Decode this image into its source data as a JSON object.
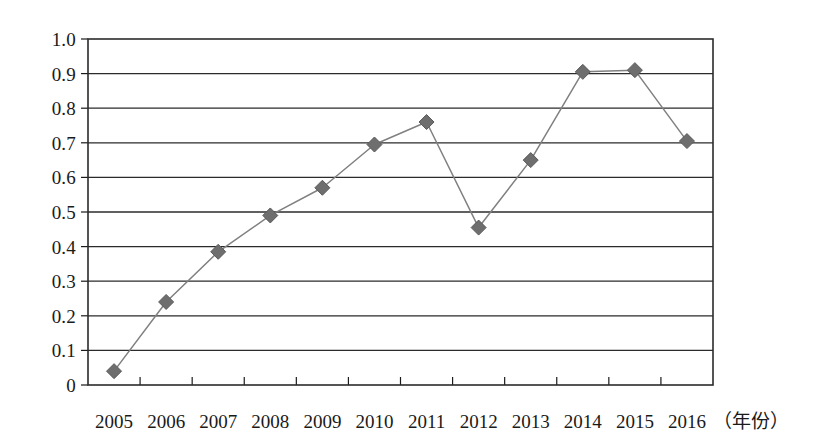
{
  "chart_data": {
    "type": "line",
    "title": "",
    "xlabel": "（年份）",
    "ylabel": "",
    "categories": [
      "2005",
      "2006",
      "2007",
      "2008",
      "2009",
      "2010",
      "2011",
      "2012",
      "2013",
      "2014",
      "2015",
      "2016"
    ],
    "values": [
      0.04,
      0.24,
      0.385,
      0.49,
      0.57,
      0.695,
      0.76,
      0.455,
      0.65,
      0.905,
      0.91,
      0.705
    ],
    "series": [
      {
        "name": "",
        "values": [
          0.04,
          0.24,
          0.385,
          0.49,
          0.57,
          0.695,
          0.76,
          0.455,
          0.65,
          0.905,
          0.91,
          0.705
        ]
      }
    ],
    "ylim": [
      0,
      1.0
    ],
    "y_ticks": [
      0,
      0.1,
      0.2,
      0.3,
      0.4,
      0.5,
      0.6,
      0.7,
      0.8,
      0.9,
      1.0
    ],
    "y_tick_labels": [
      "0",
      "0.1",
      "0.2",
      "0.3",
      "0.4",
      "0.5",
      "0.6",
      "0.7",
      "0.8",
      "0.9",
      "1.0"
    ],
    "grid": "horizontal",
    "legend": "none",
    "marker": "diamond",
    "colors": {
      "line": "#808080",
      "marker": "#6e6e6e",
      "grid": "#2b2b2b",
      "axis": "#1a1a1a",
      "background": "#ffffff",
      "text": "#1a1a1a"
    }
  }
}
